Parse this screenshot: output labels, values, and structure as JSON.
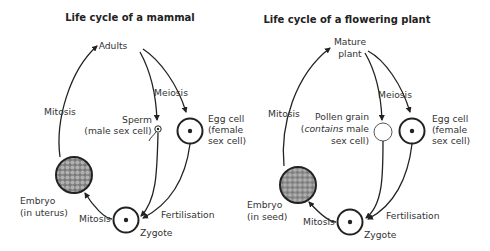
{
  "mammal": {
    "title": "Life cycle of a mammal",
    "adults": "Adults",
    "mitosis_left": "Mitosis",
    "meiosis": "Meiosis",
    "sperm_line1": "Sperm",
    "sperm_line2": "(male sex cell)",
    "egg_line1": "Egg cell",
    "egg_line2": "(female",
    "egg_line3": "sex cell)",
    "embryo_line1": "Embryo",
    "embryo_line2": "(in uterus)",
    "mitosis_bottom": "Mitosis",
    "fertilisation": "Fertilisation",
    "zygote": "Zygote"
  },
  "plant": {
    "title": "Life cycle of a flowering plant",
    "mature_line1": "Mature",
    "mature_line2": "plant",
    "mitosis_left": "Mitosis",
    "meiosis": "Meiosis",
    "pollen_line1": "Pollen grain",
    "pollen_line2_italic": "contains",
    "pollen_line2_open": "(",
    "pollen_line2_rest": " male",
    "pollen_line3": "sex cell)",
    "egg_line1": "Egg cell",
    "egg_line2": "(female",
    "egg_line3": "sex cell)",
    "embryo_line1": "Embryo",
    "embryo_line2": "(in seed)",
    "mitosis_bottom": "Mitosis",
    "fertilisation": "Fertilisation",
    "zygote": "Zygote"
  },
  "colors": {
    "line": "#222222",
    "text": "#333333",
    "embryo_fill": "#8a8a8a",
    "embryo_cell": "#a8a8a8"
  }
}
